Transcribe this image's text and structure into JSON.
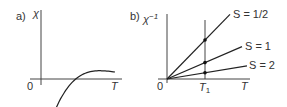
{
  "panel_a": {
    "label": "a)",
    "y_axis_label": "χ",
    "x_axis_label": "T",
    "origin_label": "0",
    "curve": "chi proportional to 1/T (decreasing hyperbola)"
  },
  "panel_b": {
    "label": "b)",
    "y_axis_label": "χ",
    "y_axis_superscript": "−1",
    "x_axis_label": "T",
    "origin_label": "0",
    "marker_label": "T",
    "marker_subscript": "1",
    "lines": [
      {
        "label": "S = 1/2",
        "slope_rel": 1.0
      },
      {
        "label": "S = 1",
        "slope_rel": 0.42
      },
      {
        "label": "S = 2",
        "slope_rel": 0.16
      }
    ]
  },
  "colors": {
    "ink": "#222222",
    "axis": "#444444"
  }
}
